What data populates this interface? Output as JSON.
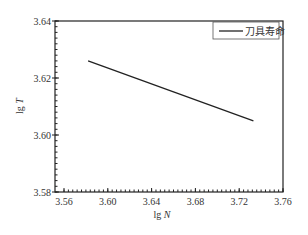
{
  "chart_data": {
    "type": "line",
    "title": "",
    "xlabel": "lg N",
    "ylabel": "lg T",
    "xlim": [
      3.56,
      3.76
    ],
    "ylim": [
      3.58,
      3.64
    ],
    "x_ticks": [
      "3.56",
      "3.60",
      "3.64",
      "3.68",
      "3.72",
      "3.76"
    ],
    "y_ticks": [
      "3.58",
      "3.60",
      "3.62",
      "3.64"
    ],
    "grid": false,
    "legend_position": "upper right",
    "series": [
      {
        "name": "刀具寿命",
        "color": "#222222",
        "x": [
          3.582,
          3.733
        ],
        "y": [
          3.626,
          3.605
        ]
      }
    ]
  },
  "labels": {
    "xlabel_prefix": "lg ",
    "xlabel_var": "N",
    "ylabel_prefix": "lg ",
    "ylabel_var": "T",
    "legend": "刀具寿命"
  }
}
